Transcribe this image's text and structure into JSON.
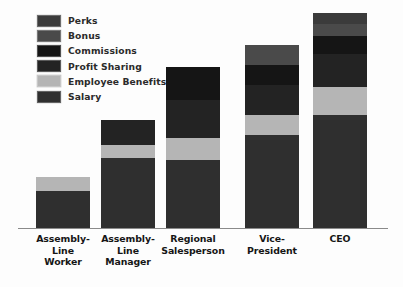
{
  "chart_data": {
    "type": "bar",
    "subtype": "stacked-bar",
    "title": "",
    "subtitle": "",
    "xlabel": "",
    "ylabel": "",
    "grid": false,
    "axis_ticks_visible": false,
    "legend_position": "top-left",
    "background_color": "#fdfdfd",
    "baseline_color": "#8a8a8a",
    "categories": [
      "Assembly-Line Worker",
      "Assembly-Line Manager",
      "Regional Salesperson",
      "Vice-President",
      "CEO"
    ],
    "category_label_lines": [
      [
        "Assembly-",
        "Line",
        "Worker"
      ],
      [
        "Assembly-",
        "Line",
        "Manager"
      ],
      [
        "Regional",
        "Salesperson"
      ],
      [
        "Vice-",
        "President"
      ],
      [
        "CEO"
      ]
    ],
    "series": [
      {
        "name": "Salary",
        "color": "#2f2f2f",
        "values": [
          37,
          70,
          68,
          93,
          113
        ]
      },
      {
        "name": "Employee Benefits",
        "color": "#b5b5b5",
        "values": [
          14,
          13,
          22,
          20,
          28
        ]
      },
      {
        "name": "Profit Sharing",
        "color": "#232323",
        "values": [
          0,
          25,
          38,
          30,
          33
        ]
      },
      {
        "name": "Commissions",
        "color": "#151515",
        "values": [
          0,
          0,
          33,
          20,
          18
        ]
      },
      {
        "name": "Bonus",
        "color": "#4a4a4a",
        "values": [
          0,
          0,
          0,
          20,
          12
        ]
      },
      {
        "name": "Perks",
        "color": "#3b3b3b",
        "values": [
          0,
          0,
          0,
          0,
          11
        ]
      }
    ],
    "totals": [
      51,
      108,
      161,
      183,
      215
    ],
    "units": "relative pixel height (unlabeled axis)"
  },
  "legend": {
    "items": [
      {
        "label": "Perks",
        "color": "#3b3b3b"
      },
      {
        "label": "Bonus",
        "color": "#4a4a4a"
      },
      {
        "label": "Commissions",
        "color": "#151515"
      },
      {
        "label": "Profit Sharing",
        "color": "#232323"
      },
      {
        "label": "Employee Benefits",
        "color": "#b5b5b5"
      },
      {
        "label": "Salary",
        "color": "#2f2f2f"
      }
    ]
  },
  "layout": {
    "bar_width": 54,
    "bar_left_positions": [
      36,
      101,
      166,
      245,
      313
    ],
    "baseline_top": 228,
    "label_tops": 233
  }
}
